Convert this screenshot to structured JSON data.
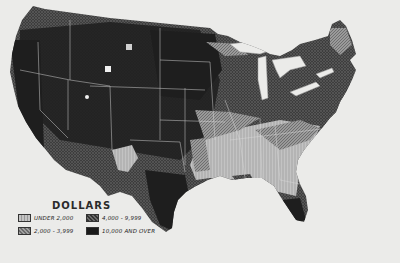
{
  "map": {
    "subject": "United States counties shaded by dollar value",
    "region": "Continental United States",
    "colors": {
      "background": "#ebebe9",
      "under_2000": "#b9b9b9",
      "2000_3999": "#8d8d8d",
      "4000_9999": "#4a4a4a",
      "10000_and_over": "#1c1c1c",
      "boundary": "#d8d8d8"
    }
  },
  "legend": {
    "title": "DOLLARS",
    "items": [
      {
        "label": "UNDER 2,000",
        "pattern": "light-vertical-hatch"
      },
      {
        "label": "2,000 - 3,999",
        "pattern": "medium-diagonal-hatch"
      },
      {
        "label": "4,000 - 9,999",
        "pattern": "dark-crosshatch"
      },
      {
        "label": "10,000 AND OVER",
        "pattern": "solid-black"
      }
    ]
  }
}
